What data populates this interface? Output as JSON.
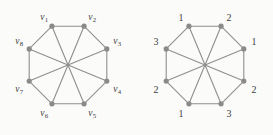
{
  "figure": {
    "background_color": "#fbfbfa",
    "edge_color": "#8f8f8f",
    "vertex_color": "#8a8a8a",
    "label_color": "#3b3b3b",
    "width": 273,
    "height": 135
  },
  "graphs": [
    {
      "id": "graph-left",
      "caption": "",
      "center": {
        "x": 68,
        "y": 65
      },
      "radius": 42,
      "vertex_radius": 2.6,
      "label_style": "subscripted-vertex-name",
      "vertices": [
        {
          "name": "v1",
          "label_main": "v",
          "label_sub": "1",
          "angle_deg": 247.5,
          "label_x": 44,
          "label_y": 18
        },
        {
          "name": "v2",
          "label_main": "v",
          "label_sub": "2",
          "angle_deg": 292.5,
          "label_x": 92,
          "label_y": 18
        },
        {
          "name": "v3",
          "label_main": "v",
          "label_sub": "3",
          "angle_deg": 337.5,
          "label_x": 117,
          "label_y": 42
        },
        {
          "name": "v4",
          "label_main": "v",
          "label_sub": "4",
          "angle_deg": 22.5,
          "label_x": 117,
          "label_y": 90
        },
        {
          "name": "v5",
          "label_main": "v",
          "label_sub": "5",
          "angle_deg": 67.5,
          "label_x": 92,
          "label_y": 114
        },
        {
          "name": "v6",
          "label_main": "v",
          "label_sub": "6",
          "angle_deg": 112.5,
          "label_x": 44,
          "label_y": 114
        },
        {
          "name": "v7",
          "label_main": "v",
          "label_sub": "7",
          "angle_deg": 157.5,
          "label_x": 19,
          "label_y": 90
        },
        {
          "name": "v8",
          "label_main": "v",
          "label_sub": "8",
          "angle_deg": 202.5,
          "label_x": 19,
          "label_y": 42
        }
      ],
      "edges": [
        [
          0,
          1
        ],
        [
          1,
          2
        ],
        [
          2,
          3
        ],
        [
          3,
          4
        ],
        [
          4,
          5
        ],
        [
          5,
          6
        ],
        [
          6,
          7
        ],
        [
          7,
          0
        ],
        [
          0,
          4
        ],
        [
          1,
          5
        ],
        [
          2,
          6
        ],
        [
          3,
          7
        ]
      ]
    },
    {
      "id": "graph-right",
      "caption": "",
      "center": {
        "x": 68,
        "y": 65
      },
      "radius": 42,
      "vertex_radius": 2.6,
      "label_style": "color-number",
      "vertices": [
        {
          "name": "c1",
          "label_main": "1",
          "label_sub": "",
          "angle_deg": 247.5,
          "label_x": 44,
          "label_y": 18
        },
        {
          "name": "c2",
          "label_main": "2",
          "label_sub": "",
          "angle_deg": 292.5,
          "label_x": 92,
          "label_y": 18
        },
        {
          "name": "c3",
          "label_main": "1",
          "label_sub": "",
          "angle_deg": 337.5,
          "label_x": 117,
          "label_y": 42
        },
        {
          "name": "c4",
          "label_main": "2",
          "label_sub": "",
          "angle_deg": 22.5,
          "label_x": 117,
          "label_y": 90
        },
        {
          "name": "c5",
          "label_main": "3",
          "label_sub": "",
          "angle_deg": 67.5,
          "label_x": 92,
          "label_y": 114
        },
        {
          "name": "c6",
          "label_main": "1",
          "label_sub": "",
          "angle_deg": 112.5,
          "label_x": 44,
          "label_y": 114
        },
        {
          "name": "c7",
          "label_main": "2",
          "label_sub": "",
          "angle_deg": 157.5,
          "label_x": 19,
          "label_y": 90
        },
        {
          "name": "c8",
          "label_main": "3",
          "label_sub": "",
          "angle_deg": 202.5,
          "label_x": 19,
          "label_y": 42
        }
      ],
      "edges": [
        [
          0,
          1
        ],
        [
          1,
          2
        ],
        [
          2,
          3
        ],
        [
          3,
          4
        ],
        [
          4,
          5
        ],
        [
          5,
          6
        ],
        [
          6,
          7
        ],
        [
          7,
          0
        ],
        [
          0,
          4
        ],
        [
          1,
          5
        ],
        [
          2,
          6
        ],
        [
          3,
          7
        ]
      ]
    }
  ]
}
